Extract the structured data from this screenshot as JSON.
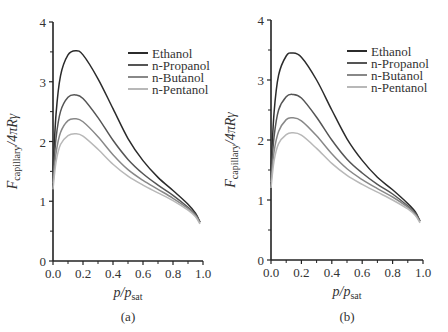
{
  "chart_data": [
    {
      "type": "line",
      "panel_label": "(a)",
      "title": "",
      "xlabel": "p/p_sat",
      "ylabel": "F_capillary/4πRγ",
      "xlim": [
        0.0,
        1.0
      ],
      "ylim": [
        0,
        4
      ],
      "xticks": [
        "0.0",
        "0.2",
        "0.4",
        "0.6",
        "0.8",
        "1.0"
      ],
      "yticks": [
        "0",
        "1",
        "2",
        "3",
        "4"
      ],
      "grid": false,
      "legend_position": "upper right",
      "x": [
        0.0,
        0.02,
        0.05,
        0.1,
        0.15,
        0.2,
        0.3,
        0.4,
        0.5,
        0.6,
        0.7,
        0.8,
        0.9,
        0.95,
        0.98
      ],
      "series": [
        {
          "name": "Ethanol",
          "color": "#2b2b2b",
          "values": [
            1.5,
            2.45,
            3.1,
            3.45,
            3.52,
            3.45,
            3.05,
            2.55,
            2.05,
            1.68,
            1.4,
            1.18,
            0.95,
            0.8,
            0.65
          ]
        },
        {
          "name": "n-Propanol",
          "color": "#555555",
          "values": [
            1.4,
            2.05,
            2.5,
            2.74,
            2.78,
            2.72,
            2.4,
            2.02,
            1.7,
            1.46,
            1.27,
            1.1,
            0.9,
            0.78,
            0.65
          ]
        },
        {
          "name": "n-Butanol",
          "color": "#888888",
          "values": [
            1.3,
            1.8,
            2.15,
            2.35,
            2.38,
            2.33,
            2.08,
            1.78,
            1.53,
            1.35,
            1.2,
            1.05,
            0.88,
            0.76,
            0.64
          ]
        },
        {
          "name": "n-Pentanol",
          "color": "#b8b8b8",
          "values": [
            1.2,
            1.65,
            1.95,
            2.1,
            2.13,
            2.09,
            1.87,
            1.62,
            1.42,
            1.27,
            1.14,
            1.01,
            0.85,
            0.74,
            0.62
          ]
        }
      ]
    },
    {
      "type": "line",
      "panel_label": "(b)",
      "title": "",
      "xlabel": "p/p_sat",
      "ylabel": "F_capillary/4πRγ",
      "xlim": [
        0.0,
        1.0
      ],
      "ylim": [
        0,
        4
      ],
      "xticks": [
        "0.0",
        "0.2",
        "0.4",
        "0.6",
        "0.8",
        "1.0"
      ],
      "yticks": [
        "0",
        "1",
        "2",
        "3",
        "4"
      ],
      "grid": false,
      "legend_position": "upper right",
      "x": [
        0.0,
        0.02,
        0.05,
        0.1,
        0.14,
        0.2,
        0.3,
        0.4,
        0.5,
        0.6,
        0.7,
        0.8,
        0.9,
        0.95,
        0.98
      ],
      "series": [
        {
          "name": "Ethanol",
          "color": "#2b2b2b",
          "values": [
            1.5,
            2.45,
            3.08,
            3.4,
            3.45,
            3.38,
            3.0,
            2.5,
            2.02,
            1.66,
            1.38,
            1.17,
            0.94,
            0.8,
            0.65
          ]
        },
        {
          "name": "n-Propanol",
          "color": "#555555",
          "values": [
            1.4,
            2.05,
            2.5,
            2.72,
            2.76,
            2.7,
            2.38,
            2.0,
            1.68,
            1.45,
            1.26,
            1.1,
            0.9,
            0.78,
            0.65
          ]
        },
        {
          "name": "n-Butanol",
          "color": "#888888",
          "values": [
            1.3,
            1.8,
            2.14,
            2.34,
            2.37,
            2.32,
            2.07,
            1.77,
            1.52,
            1.34,
            1.19,
            1.05,
            0.88,
            0.76,
            0.64
          ]
        },
        {
          "name": "n-Pentanol",
          "color": "#b8b8b8",
          "values": [
            1.2,
            1.65,
            1.94,
            2.09,
            2.12,
            2.08,
            1.86,
            1.61,
            1.41,
            1.26,
            1.13,
            1.0,
            0.85,
            0.74,
            0.62
          ]
        }
      ]
    }
  ],
  "panels": [
    {
      "label": "(a)",
      "xlabel_main": "p",
      "xlabel_sub": "sat",
      "ylabel_main": "F",
      "ylabel_sub": "capillary",
      "ylabel_rest": "/4πRγ"
    },
    {
      "label": "(b)",
      "xlabel_main": "p",
      "xlabel_sub": "sat",
      "ylabel_main": "F",
      "ylabel_sub": "capillary",
      "ylabel_rest": "/4πRγ"
    }
  ]
}
